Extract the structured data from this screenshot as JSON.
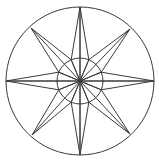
{
  "figure": {
    "background_color": "#ffffff",
    "stroke_color": "#3a3a3a",
    "stroke_width": 1
  },
  "canvas": {
    "width": 159,
    "height": 163
  },
  "chart_data": {
    "type": "diagram",
    "center": {
      "x": 80,
      "y": 81
    },
    "outer_circle": {
      "cx": 80,
      "cy": 81,
      "r": 74
    },
    "inner_circle": {
      "cx": 80,
      "cy": 81,
      "r": 23
    },
    "point_count": 8,
    "cardinal_points": [
      {
        "name": "north",
        "angle_deg": 270,
        "tip_x": 80,
        "tip_y": 7,
        "length": 74
      },
      {
        "name": "east",
        "angle_deg": 0,
        "tip_x": 154,
        "tip_y": 81,
        "length": 74
      },
      {
        "name": "south",
        "angle_deg": 90,
        "tip_x": 80,
        "tip_y": 155,
        "length": 74
      },
      {
        "name": "west",
        "angle_deg": 180,
        "tip_x": 6,
        "tip_y": 81,
        "length": 74
      }
    ],
    "ordinal_points": [
      {
        "name": "northwest",
        "angle_deg": 225,
        "tip_x": 31,
        "tip_y": 28,
        "length": 72
      },
      {
        "name": "northeast",
        "angle_deg": 315,
        "tip_x": 130,
        "tip_y": 29,
        "length": 72
      },
      {
        "name": "southeast",
        "angle_deg": 45,
        "tip_x": 130,
        "tip_y": 134,
        "length": 72
      },
      {
        "name": "southwest",
        "angle_deg": 135,
        "tip_x": 32,
        "tip_y": 135,
        "length": 72
      }
    ],
    "ray_half_width_deg": 22.5,
    "ray_base_radius": 23,
    "grid": false,
    "legend": false,
    "axis_lines": [
      {
        "name": "horizontal-axis",
        "x1": 6,
        "y1": 81,
        "x2": 154,
        "y2": 81
      },
      {
        "name": "vertical-axis",
        "x1": 80,
        "y1": 7,
        "x2": 80,
        "y2": 155
      }
    ]
  }
}
